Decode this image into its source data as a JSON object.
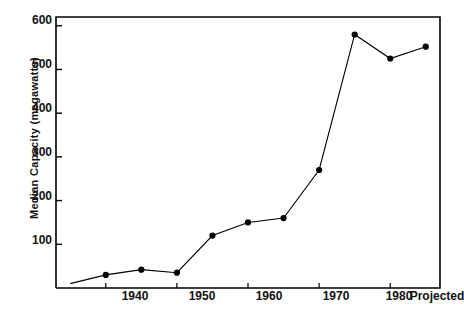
{
  "chart_data": {
    "type": "line",
    "title": "",
    "xlabel": "",
    "ylabel": "Median  Capacity (megawatts)",
    "x": [
      1935,
      1940,
      1945,
      1950,
      1955,
      1960,
      1965,
      1970,
      1975,
      1980,
      1985
    ],
    "values": [
      10,
      30,
      42,
      35,
      120,
      150,
      160,
      270,
      580,
      525,
      552
    ],
    "xtick_labels": [
      "1940",
      "1950",
      "1960",
      "1970",
      "1980",
      "Projected"
    ],
    "xtick_values": [
      1940,
      1950,
      1960,
      1970,
      1980,
      1985
    ],
    "ytick_labels": [
      "100",
      "200",
      "300",
      "400",
      "500",
      "600"
    ],
    "ytick_values": [
      100,
      200,
      300,
      400,
      500,
      600
    ],
    "xlim": [
      1933,
      1987
    ],
    "ylim": [
      0,
      620
    ],
    "grid": false,
    "legend": "none",
    "marker": "filled-circle",
    "line_color": "#000000",
    "marker_color": "#000000",
    "axis_color": "#000000",
    "background": "#ffffff"
  }
}
